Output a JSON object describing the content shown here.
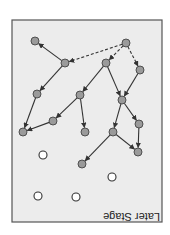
{
  "diagram": {
    "title": "Later Stage",
    "orientation": "rotated-180",
    "colors": {
      "background": "#ffffff",
      "panel_fill": "#ececec",
      "panel_stroke": "#555555",
      "node_fill": "#9a9a9a",
      "node_stroke": "#444444",
      "empty_node_fill": "#ffffff",
      "empty_node_stroke": "#333333",
      "edge": "#333333"
    },
    "panel": {
      "x": 12,
      "y": 20,
      "w": 150,
      "h": 202
    },
    "label_pos": {
      "x": 160,
      "y": 213
    },
    "nodes": [
      {
        "id": "A",
        "x": 35,
        "y": 41,
        "filled": true
      },
      {
        "id": "B",
        "x": 65,
        "y": 63,
        "filled": true
      },
      {
        "id": "C",
        "x": 126,
        "y": 43,
        "filled": true
      },
      {
        "id": "D",
        "x": 106,
        "y": 63,
        "filled": true
      },
      {
        "id": "E",
        "x": 140,
        "y": 70,
        "filled": true
      },
      {
        "id": "F",
        "x": 37,
        "y": 94,
        "filled": true
      },
      {
        "id": "G",
        "x": 80,
        "y": 95,
        "filled": true
      },
      {
        "id": "H",
        "x": 53,
        "y": 121,
        "filled": true
      },
      {
        "id": "I",
        "x": 23,
        "y": 132,
        "filled": true
      },
      {
        "id": "J",
        "x": 85,
        "y": 132,
        "filled": true
      },
      {
        "id": "K",
        "x": 122,
        "y": 100,
        "filled": true
      },
      {
        "id": "L",
        "x": 139,
        "y": 124,
        "filled": true
      },
      {
        "id": "M",
        "x": 113,
        "y": 132,
        "filled": true
      },
      {
        "id": "N",
        "x": 138,
        "y": 152,
        "filled": true
      },
      {
        "id": "O",
        "x": 82,
        "y": 164,
        "filled": true
      },
      {
        "id": "P",
        "x": 43,
        "y": 155,
        "filled": false
      },
      {
        "id": "Q",
        "x": 112,
        "y": 177,
        "filled": false
      },
      {
        "id": "R",
        "x": 38,
        "y": 196,
        "filled": false
      },
      {
        "id": "S",
        "x": 76,
        "y": 197,
        "filled": false
      }
    ],
    "edges": [
      {
        "from": "B",
        "to": "A",
        "dashed": false
      },
      {
        "from": "C",
        "to": "B",
        "dashed": true
      },
      {
        "from": "C",
        "to": "D",
        "dashed": true
      },
      {
        "from": "C",
        "to": "E",
        "dashed": true
      },
      {
        "from": "B",
        "to": "F",
        "dashed": false
      },
      {
        "from": "D",
        "to": "G",
        "dashed": false
      },
      {
        "from": "D",
        "to": "K",
        "dashed": false
      },
      {
        "from": "E",
        "to": "K",
        "dashed": false
      },
      {
        "from": "F",
        "to": "I",
        "dashed": false
      },
      {
        "from": "G",
        "to": "H",
        "dashed": false
      },
      {
        "from": "H",
        "to": "I",
        "dashed": false
      },
      {
        "from": "G",
        "to": "J",
        "dashed": false
      },
      {
        "from": "K",
        "to": "L",
        "dashed": false
      },
      {
        "from": "K",
        "to": "M",
        "dashed": false
      },
      {
        "from": "L",
        "to": "N",
        "dashed": false
      },
      {
        "from": "M",
        "to": "N",
        "dashed": false
      },
      {
        "from": "M",
        "to": "O",
        "dashed": false
      }
    ]
  }
}
